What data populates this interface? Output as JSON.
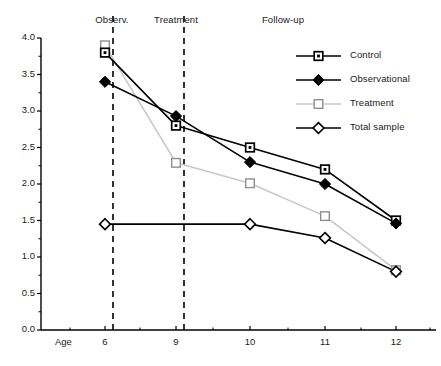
{
  "figure": {
    "title": "",
    "caption": ""
  },
  "annotations": {
    "periods": [
      {
        "name": "observation-period-label",
        "label": "Observ.",
        "x_center": 112,
        "y": 14
      },
      {
        "name": "treatment-period-label",
        "label": "Treatment",
        "x_center": 176,
        "y": 14
      },
      {
        "name": "followup-period-label",
        "label": "Follow-up",
        "x_center": 283,
        "y": 14
      }
    ],
    "divider_ages": [
      6,
      9
    ]
  },
  "axes": {
    "x_axis_name": "Age",
    "y_ticks": [
      "0.0",
      "0.5",
      "1.0",
      "1.5",
      "2.0",
      "2.5",
      "3.0",
      "3.5",
      "4.0"
    ],
    "x_ticks": [
      "6",
      "9",
      "10",
      "11",
      "12"
    ]
  },
  "legend": {
    "items": [
      {
        "label": "Control",
        "marker": "square-dot",
        "color": "#000000"
      },
      {
        "label": "Observational",
        "marker": "diamond-filled",
        "color": "#000000"
      },
      {
        "label": "Treatment",
        "marker": "square-open",
        "color": "#c8c8c8"
      },
      {
        "label": "Total sample",
        "marker": "diamond-open",
        "color": "#000000"
      }
    ]
  },
  "chart_data": {
    "type": "line",
    "title": "",
    "subtitle": "",
    "xlabel": "Age",
    "ylabel": "",
    "x": [
      6,
      9,
      10,
      11,
      12
    ],
    "xlim": [
      5.2,
      12.6
    ],
    "ylim": [
      0.0,
      4.0
    ],
    "yticks": [
      0.0,
      0.5,
      1.0,
      1.5,
      2.0,
      2.5,
      3.0,
      3.5,
      4.0
    ],
    "minor_ytick_step": 0.25,
    "grid": false,
    "legend_position": "upper-right",
    "series": [
      {
        "name": "Control",
        "color": "#000000",
        "marker": "square-dot",
        "x": [
          6,
          9,
          10,
          11,
          12
        ],
        "values": [
          3.8,
          2.8,
          2.5,
          2.2,
          1.5
        ]
      },
      {
        "name": "Observational",
        "color": "#000000",
        "marker": "diamond-filled",
        "x": [
          6,
          9,
          10,
          11,
          12
        ],
        "values": [
          3.4,
          2.93,
          2.3,
          2.0,
          1.46
        ]
      },
      {
        "name": "Treatment",
        "color": "#c8c8c8",
        "marker": "square-open",
        "x": [
          6,
          9,
          10,
          11,
          12
        ],
        "values": [
          3.9,
          2.29,
          2.01,
          1.56,
          0.82
        ]
      },
      {
        "name": "Total sample",
        "color": "#000000",
        "marker": "diamond-open",
        "x": [
          6,
          10,
          11,
          12
        ],
        "values": [
          1.45,
          1.45,
          1.26,
          0.8
        ]
      }
    ],
    "annotations": [
      {
        "text": "Observ.",
        "at_x": 6.0,
        "position": "top"
      },
      {
        "text": "Treatment",
        "at_x": 9.0,
        "position": "top"
      },
      {
        "text": "Follow-up",
        "at_x": 10.6,
        "position": "top"
      }
    ]
  }
}
